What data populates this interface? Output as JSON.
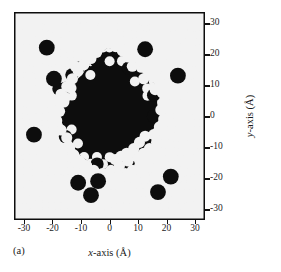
{
  "figure": {
    "panel_label": "(a)",
    "background_color": "#ffffff",
    "plot_background_color": "#0d0d0d",
    "atom_color": "#f2f2f2",
    "axis_color": "#111111"
  },
  "axes": {
    "x_title_var": "x",
    "x_title_rest": "-axis (",
    "x_title_unit": "Å",
    "x_title_close": ")",
    "x_title_full": "x-axis (Å)",
    "y_title_var": "y",
    "y_title_rest": "-axis (",
    "y_title_unit": "Å",
    "y_title_close": ")",
    "y_title_full": "y-axis (Å)",
    "x_ticks": [
      "-30",
      "-20",
      "-10",
      "0",
      "10",
      "20",
      "30"
    ],
    "y_ticks": [
      "30",
      "20",
      "10",
      "0",
      "-10",
      "-20",
      "-30"
    ]
  },
  "chart_data": {
    "type": "scatter",
    "title": "",
    "subtitle": "",
    "xlabel": "x-axis (Å)",
    "ylabel": "y-axis (Å)",
    "xlim": [
      -33.5,
      33.5
    ],
    "ylim": [
      -33.5,
      33.5
    ],
    "xticks": [
      -30,
      -20,
      -10,
      0,
      10,
      20,
      30
    ],
    "yticks": [
      -30,
      -20,
      -10,
      0,
      10,
      20,
      30
    ],
    "grid": false,
    "legend": null,
    "annotations": [
      {
        "text": "(a)",
        "position": "below-left-of-axes"
      }
    ],
    "series": [
      {
        "name": "lattice atoms",
        "marker": "filled-circle",
        "marker_color": "#f2f2f2",
        "marker_diameter_angstrom": 3.7,
        "lattice_type": "square",
        "lattice_spacing_angstrom": 2.21,
        "lattice_origin": [
          0,
          0
        ],
        "lattice_rotation_deg": 0,
        "x_range": [
          -33.5,
          33.5
        ],
        "y_range": [
          -33.5,
          33.5
        ],
        "count_estimate": 860
      },
      {
        "name": "disordered core (black region)",
        "marker": "filled-region",
        "fill_color": "#0d0d0d",
        "center": [
          -1.0,
          1.0
        ],
        "mean_radius_angstrom": 15.5,
        "boundary_polygon": [
          [
            -0.5,
            22.0
          ],
          [
            2.5,
            21.5
          ],
          [
            4.5,
            20.0
          ],
          [
            6.0,
            18.0
          ],
          [
            9.0,
            17.5
          ],
          [
            11.5,
            16.0
          ],
          [
            12.0,
            13.0
          ],
          [
            14.0,
            11.5
          ],
          [
            16.0,
            10.5
          ],
          [
            17.0,
            7.5
          ],
          [
            16.5,
            4.0
          ],
          [
            17.5,
            1.0
          ],
          [
            17.0,
            -2.5
          ],
          [
            15.0,
            -4.5
          ],
          [
            13.5,
            -7.0
          ],
          [
            14.5,
            -10.0
          ],
          [
            13.0,
            -12.5
          ],
          [
            10.0,
            -13.5
          ],
          [
            7.0,
            -14.0
          ],
          [
            4.0,
            -15.5
          ],
          [
            1.0,
            -16.5
          ],
          [
            -2.0,
            -17.0
          ],
          [
            -5.0,
            -16.0
          ],
          [
            -7.5,
            -14.5
          ],
          [
            -10.0,
            -13.0
          ],
          [
            -12.0,
            -11.0
          ],
          [
            -13.5,
            -8.0
          ],
          [
            -14.0,
            -5.0
          ],
          [
            -16.5,
            -3.0
          ],
          [
            -17.5,
            0.0
          ],
          [
            -16.0,
            3.0
          ],
          [
            -14.5,
            5.5
          ],
          [
            -15.5,
            8.0
          ],
          [
            -13.5,
            10.5
          ],
          [
            -11.0,
            12.0
          ],
          [
            -9.0,
            14.0
          ],
          [
            -7.5,
            16.5
          ],
          [
            -5.0,
            18.5
          ],
          [
            -3.0,
            20.5
          ]
        ]
      },
      {
        "name": "displaced / interstitial atoms",
        "marker": "filled-circle",
        "marker_color": "#f2f2f2",
        "description": "Bright atoms scattered just outside and on the rim of the black core, plus chains extending to the lower-right.",
        "points": [
          [
            -0.5,
            23.5
          ],
          [
            2.0,
            22.5
          ],
          [
            4.5,
            21.0
          ],
          [
            -3.5,
            22.0
          ],
          [
            6.5,
            19.0
          ],
          [
            9.0,
            19.0
          ],
          [
            11.0,
            17.5
          ],
          [
            8.0,
            16.0
          ],
          [
            12.5,
            15.5
          ],
          [
            14.5,
            14.0
          ],
          [
            12.0,
            12.0
          ],
          [
            15.5,
            12.5
          ],
          [
            17.5,
            11.0
          ],
          [
            16.0,
            8.5
          ],
          [
            18.5,
            7.5
          ],
          [
            19.5,
            4.5
          ],
          [
            18.0,
            2.0
          ],
          [
            19.0,
            -1.0
          ],
          [
            17.5,
            -3.5
          ],
          [
            15.5,
            -6.0
          ],
          [
            16.5,
            -8.5
          ],
          [
            14.0,
            -10.5
          ],
          [
            12.0,
            -12.0
          ],
          [
            9.5,
            -13.0
          ],
          [
            6.5,
            -14.5
          ],
          [
            3.5,
            -16.0
          ],
          [
            0.5,
            -17.5
          ],
          [
            -2.5,
            -18.5
          ],
          [
            -5.5,
            -17.5
          ],
          [
            -8.0,
            -16.0
          ],
          [
            -10.5,
            -14.5
          ],
          [
            -12.5,
            -12.5
          ],
          [
            -14.0,
            -10.0
          ],
          [
            -15.0,
            -7.0
          ],
          [
            -17.0,
            -4.5
          ],
          [
            -18.5,
            -1.5
          ],
          [
            -17.5,
            1.5
          ],
          [
            -16.0,
            4.5
          ],
          [
            -17.0,
            7.0
          ],
          [
            -15.0,
            9.5
          ],
          [
            -13.0,
            12.0
          ],
          [
            -11.0,
            14.5
          ],
          [
            -9.0,
            16.5
          ],
          [
            -6.5,
            18.5
          ],
          [
            -4.5,
            20.5
          ],
          [
            -13.5,
            9.0
          ],
          [
            -15.5,
            6.0
          ],
          [
            -12.0,
            16.0
          ],
          [
            13.0,
            -15.0
          ],
          [
            10.5,
            -16.5
          ],
          [
            8.0,
            -17.5
          ],
          [
            5.5,
            -18.5
          ],
          [
            3.0,
            -19.5
          ],
          [
            15.0,
            -13.5
          ],
          [
            16.5,
            -11.5
          ],
          [
            11.5,
            -18.0
          ],
          [
            14.0,
            -16.5
          ],
          [
            6.0,
            -12.0
          ],
          [
            8.5,
            -10.5
          ],
          [
            10.5,
            -8.5
          ],
          [
            12.5,
            -6.5
          ],
          [
            4.0,
            -13.0
          ],
          [
            2.0,
            -14.0
          ]
        ],
        "count_estimate": 63
      }
    ]
  }
}
